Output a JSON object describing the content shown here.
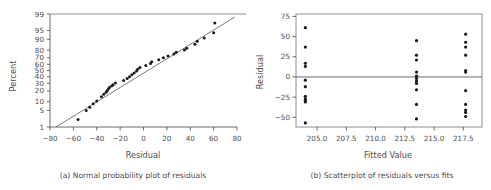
{
  "figure": {
    "panels": [
      {
        "id": "a",
        "caption": "(a) Normal probability plot of residuals"
      },
      {
        "id": "b",
        "caption": "(b) Scatterplot of residuals versus fits"
      }
    ]
  },
  "chart_data": [
    {
      "type": "scatter",
      "id": "normal-probability-plot",
      "title": "(a) Normal probability plot of residuals",
      "xlabel": "Residual",
      "ylabel": "Percent",
      "xlim": [
        -80,
        80
      ],
      "ylim": [
        1,
        99
      ],
      "yscale": "normal-probability",
      "grid": false,
      "legend": null,
      "xticks": [
        -80,
        -60,
        -40,
        -20,
        0,
        20,
        40,
        60,
        80
      ],
      "xticklabels": [
        "−80",
        "−60",
        "−40",
        "−20",
        "0",
        "20",
        "40",
        "60",
        "80"
      ],
      "yticks": [
        1,
        5,
        10,
        20,
        30,
        40,
        50,
        60,
        70,
        80,
        90,
        95,
        99
      ],
      "yticklabels": [
        "1",
        "5",
        "10",
        "20",
        "30",
        "40",
        "50",
        "60",
        "70",
        "80",
        "90",
        "95",
        "99"
      ],
      "reference_line": {
        "x": [
          -75,
          78
        ],
        "percent": [
          1.0,
          98.6
        ]
      },
      "points": [
        {
          "x": -56,
          "percent": 2.2
        },
        {
          "x": -49,
          "percent": 5.0
        },
        {
          "x": -46,
          "percent": 6.5
        },
        {
          "x": -43,
          "percent": 8.5
        },
        {
          "x": -40,
          "percent": 10.5
        },
        {
          "x": -36,
          "percent": 14.0
        },
        {
          "x": -34,
          "percent": 16.5
        },
        {
          "x": -32,
          "percent": 18.5
        },
        {
          "x": -31,
          "percent": 20.5
        },
        {
          "x": -30,
          "percent": 22.5
        },
        {
          "x": -29,
          "percent": 24.5
        },
        {
          "x": -27,
          "percent": 26.5
        },
        {
          "x": -26,
          "percent": 28.0
        },
        {
          "x": -24,
          "percent": 30.5
        },
        {
          "x": -17,
          "percent": 34.0
        },
        {
          "x": -14,
          "percent": 37.0
        },
        {
          "x": -12,
          "percent": 40.0
        },
        {
          "x": -10,
          "percent": 43.0
        },
        {
          "x": -8,
          "percent": 46.0
        },
        {
          "x": -6,
          "percent": 49.0
        },
        {
          "x": -5,
          "percent": 52.0
        },
        {
          "x": -3,
          "percent": 55.0
        },
        {
          "x": 2,
          "percent": 58.0
        },
        {
          "x": 6,
          "percent": 61.5
        },
        {
          "x": 7,
          "percent": 64.0
        },
        {
          "x": 13,
          "percent": 67.0
        },
        {
          "x": 17,
          "percent": 70.0
        },
        {
          "x": 21,
          "percent": 72.5
        },
        {
          "x": 26,
          "percent": 75.0
        },
        {
          "x": 28,
          "percent": 77.5
        },
        {
          "x": 35,
          "percent": 80.0
        },
        {
          "x": 37,
          "percent": 82.0
        },
        {
          "x": 44,
          "percent": 86.0
        },
        {
          "x": 46,
          "percent": 88.5
        },
        {
          "x": 52,
          "percent": 91.0
        },
        {
          "x": 60,
          "percent": 94.0
        },
        {
          "x": 61,
          "percent": 97.5
        }
      ]
    },
    {
      "type": "scatter",
      "id": "residuals-versus-fits",
      "title": "(b) Scatterplot of residuals versus fits",
      "xlabel": "Fitted Value",
      "ylabel": "Residual",
      "xlim": [
        203.2,
        219.1
      ],
      "ylim": [
        -62,
        78
      ],
      "grid": false,
      "legend": null,
      "xticks": [
        205.0,
        207.5,
        210.0,
        212.5,
        215.0,
        217.5
      ],
      "xticklabels": [
        "205.0",
        "207.5",
        "210.0",
        "212.5",
        "215.0",
        "217.5"
      ],
      "yticks": [
        -50,
        -25,
        0,
        25,
        50,
        75
      ],
      "yticklabels": [
        "−50",
        "−25",
        "0",
        "25",
        "50",
        "75"
      ],
      "zero_reference_line": 0,
      "points": [
        {
          "x": 204.0,
          "y": 61
        },
        {
          "x": 204.0,
          "y": 37
        },
        {
          "x": 204.0,
          "y": 17
        },
        {
          "x": 204.0,
          "y": 13
        },
        {
          "x": 204.0,
          "y": -4
        },
        {
          "x": 204.0,
          "y": -12
        },
        {
          "x": 204.0,
          "y": -24
        },
        {
          "x": 204.0,
          "y": -27
        },
        {
          "x": 204.0,
          "y": -29
        },
        {
          "x": 204.0,
          "y": -31
        },
        {
          "x": 204.0,
          "y": -57
        },
        {
          "x": 213.5,
          "y": 45
        },
        {
          "x": 213.5,
          "y": 27
        },
        {
          "x": 213.5,
          "y": 21
        },
        {
          "x": 213.5,
          "y": 6
        },
        {
          "x": 213.5,
          "y": 1
        },
        {
          "x": 213.5,
          "y": -2
        },
        {
          "x": 213.5,
          "y": -5
        },
        {
          "x": 213.5,
          "y": -8
        },
        {
          "x": 213.5,
          "y": -16
        },
        {
          "x": 213.5,
          "y": -34
        },
        {
          "x": 213.5,
          "y": -52
        },
        {
          "x": 217.7,
          "y": 53
        },
        {
          "x": 217.7,
          "y": 43
        },
        {
          "x": 217.7,
          "y": 37
        },
        {
          "x": 217.7,
          "y": 27
        },
        {
          "x": 217.7,
          "y": 8
        },
        {
          "x": 217.7,
          "y": 6
        },
        {
          "x": 217.7,
          "y": -17
        },
        {
          "x": 217.7,
          "y": -34
        },
        {
          "x": 217.7,
          "y": -41
        },
        {
          "x": 217.7,
          "y": -44
        },
        {
          "x": 217.7,
          "y": -49
        }
      ]
    }
  ]
}
